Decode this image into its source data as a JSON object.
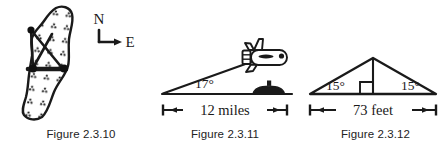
{
  "page": {
    "background_color": "#ffffff",
    "ink_color": "#1a1a1a",
    "figure_count": 3
  },
  "figures": [
    {
      "id": "figure-2-3-10",
      "caption": "Figure 2.3.10",
      "description": "Stippled lake / island outline with a surveying triangle drawn across it and a compass rose",
      "compass": {
        "north_label": "N",
        "east_label": "E"
      },
      "markers": {
        "vertex_count": 3,
        "baseline_label": ""
      }
    },
    {
      "id": "figure-2-3-11",
      "caption": "Figure 2.3.11",
      "description": "Airplane above a submarine on the water line, with an angle of elevation and a horizontal distance",
      "angle_label": "17°",
      "distance_label": "12 miles",
      "objects": [
        "airplane",
        "submarine",
        "ground-line"
      ]
    },
    {
      "id": "figure-2-3-12",
      "caption": "Figure 2.3.12",
      "description": "Isosceles triangle roof cross-section with equal base angles, a vertical altitude with right-angle mark, and a base dimension",
      "left_angle_label": "15°",
      "right_angle_label": "15°",
      "base_label": "73 feet",
      "right_angle_marker": true
    }
  ]
}
